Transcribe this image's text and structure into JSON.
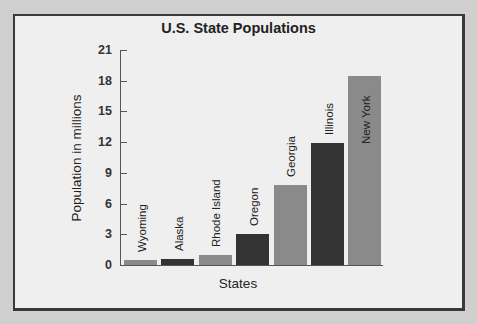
{
  "chart_data": {
    "type": "bar",
    "title": "U.S. State Populations",
    "xlabel": "States",
    "ylabel": "Population in millions",
    "categories": [
      "Wyoming",
      "Alaska",
      "Rhode Island",
      "Oregon",
      "Georgia",
      "Illinois",
      "New York"
    ],
    "values": [
      0.5,
      0.6,
      1.0,
      3.0,
      7.8,
      11.9,
      18.5
    ],
    "bar_colors": [
      "#8a8a8a",
      "#333333",
      "#8a8a8a",
      "#333333",
      "#8a8a8a",
      "#333333",
      "#8a8a8a"
    ],
    "yticks": [
      0,
      3,
      6,
      9,
      12,
      15,
      18,
      21
    ],
    "ylim": [
      0,
      21
    ],
    "grid": false,
    "legend": null
  },
  "title": "U.S. State Populations",
  "xlabel": "States",
  "ylabel": "Population in millions"
}
